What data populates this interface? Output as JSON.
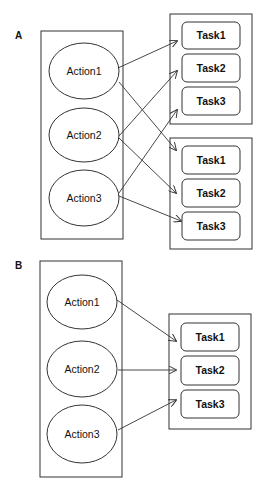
{
  "panels": [
    {
      "label": "A",
      "actions": [
        "Action1",
        "Action2",
        "Action3"
      ],
      "task_groups": [
        [
          "Task1",
          "Task2",
          "Task3"
        ],
        [
          "Task1",
          "Task2",
          "Task3"
        ]
      ],
      "edges": [
        {
          "from": "Action1",
          "to_group": 0,
          "to": "Task1"
        },
        {
          "from": "Action1",
          "to_group": 1,
          "to": "Task1"
        },
        {
          "from": "Action2",
          "to_group": 0,
          "to": "Task2"
        },
        {
          "from": "Action2",
          "to_group": 1,
          "to": "Task2"
        },
        {
          "from": "Action3",
          "to_group": 0,
          "to": "Task3"
        },
        {
          "from": "Action3",
          "to_group": 1,
          "to": "Task3"
        }
      ]
    },
    {
      "label": "B",
      "actions": [
        "Action1",
        "Action2",
        "Action3"
      ],
      "task_groups": [
        [
          "Task1",
          "Task2",
          "Task3"
        ]
      ],
      "edges": [
        {
          "from": "Action1",
          "to_group": 0,
          "to": "Task1"
        },
        {
          "from": "Action2",
          "to_group": 0,
          "to": "Task2"
        },
        {
          "from": "Action3",
          "to_group": 0,
          "to": "Task3"
        }
      ]
    }
  ]
}
